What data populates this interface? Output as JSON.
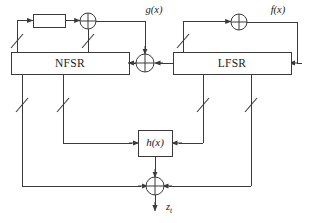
{
  "diagram": {
    "colors": {
      "line": "#3a3a3a",
      "text": "#1a1a1a",
      "background": "#ffffff"
    },
    "blocks": {
      "nfsr": {
        "label": "NFSR",
        "x": 11,
        "y": 52,
        "width": 118,
        "height": 22
      },
      "lfsr": {
        "label": "LFSR",
        "x": 173,
        "y": 52,
        "width": 118,
        "height": 22
      },
      "h_function": {
        "label": "h(x)",
        "x": 138,
        "y": 130,
        "width": 34,
        "height": 26
      },
      "tap_block": {
        "label": "",
        "x": 33,
        "y": 14,
        "width": 32,
        "height": 13
      }
    },
    "xors": [
      {
        "name": "nfsr-feedback-xor",
        "cx": 88,
        "cy": 21,
        "r": 8
      },
      {
        "name": "lfsr-feedback-xor",
        "cx": 239,
        "cy": 22,
        "r": 8
      },
      {
        "name": "nfsr-input-xor",
        "cx": 145,
        "cy": 63,
        "r": 9
      },
      {
        "name": "keystream-output-xor",
        "cx": 155,
        "cy": 186,
        "r": 9
      }
    ],
    "labels": {
      "g_function": "g(x)",
      "f_function": "f(x)",
      "h_function": "h(x)",
      "nfsr": "NFSR",
      "lfsr": "LFSR",
      "output_base": "z",
      "output_subscript": "t"
    },
    "taps": [
      {
        "name": "nfsr-feedback-tap-left",
        "x": 17,
        "y": 44
      },
      {
        "name": "nfsr-feedback-tap-right",
        "x": 88,
        "y": 44
      },
      {
        "name": "nfsr-output-tap-left",
        "x": 22,
        "y": 105
      },
      {
        "name": "nfsr-output-tap-right",
        "x": 63,
        "y": 105
      },
      {
        "name": "lfsr-feedback-tap",
        "x": 183,
        "y": 44
      },
      {
        "name": "lfsr-output-tap-left",
        "x": 203,
        "y": 105
      },
      {
        "name": "lfsr-output-tap-right",
        "x": 251,
        "y": 105
      }
    ]
  }
}
